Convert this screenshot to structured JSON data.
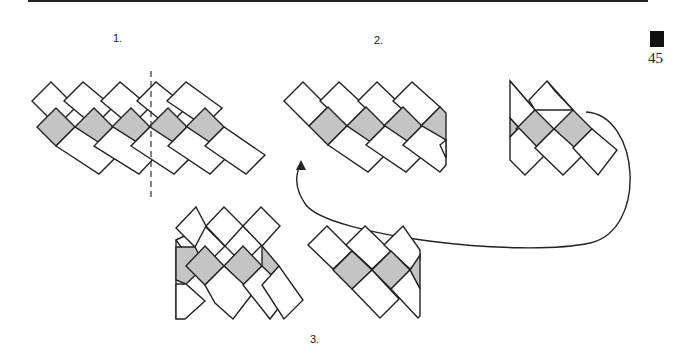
{
  "page": {
    "number": "45"
  },
  "steps": [
    {
      "id": "step-1",
      "label": "1."
    },
    {
      "id": "step-2",
      "label": "2."
    },
    {
      "id": "step-3",
      "label": "3."
    }
  ],
  "colors": {
    "fill_shaded": "#c4c4c4",
    "stroke": "#222222",
    "background": "#ffffff",
    "page_tab": "#111111"
  }
}
